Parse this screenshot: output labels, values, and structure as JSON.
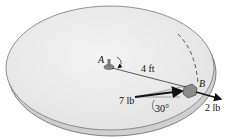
{
  "diagram": {
    "point_a": "A",
    "point_b": "B",
    "distance_label": "4 ft",
    "force_tangential": "7 lb",
    "force_radial": "2 lb",
    "angle_label": "30°"
  },
  "colors": {
    "disk_top": "#ebebeb",
    "disk_edge": "#c8c8c8",
    "outline": "#555555",
    "arrow": "#111111",
    "block": "#8a8a8a"
  }
}
